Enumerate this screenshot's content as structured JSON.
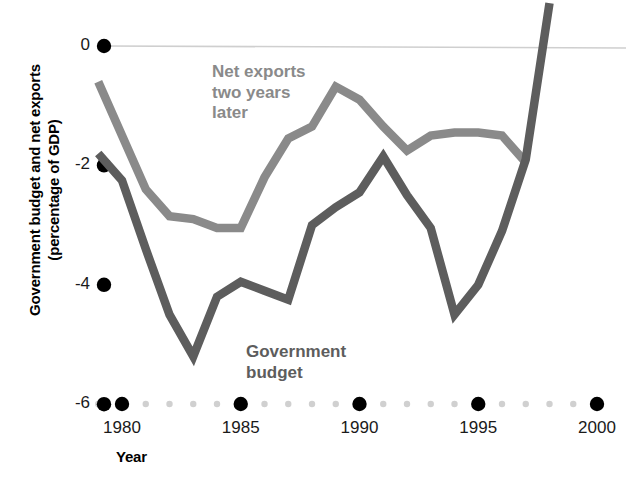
{
  "chart_data": {
    "type": "line",
    "title": "",
    "xlabel": "Year",
    "ylabel": "Government budget and net exports (percentage of GDP)",
    "ylabel_line1": "Government budget and net exports",
    "ylabel_line2": "(percentage of GDP)",
    "xlim": [
      1979,
      2000.5
    ],
    "ylim": [
      -6,
      1
    ],
    "grid": false,
    "zero_line": true,
    "x_tick_labels": [
      "1980",
      "1985",
      "1990",
      "1995",
      "2000"
    ],
    "x_tick_values": [
      1980,
      1985,
      1990,
      1995,
      2000
    ],
    "x_minor_values": [
      1979,
      1981,
      1982,
      1983,
      1984,
      1986,
      1987,
      1988,
      1989,
      1991,
      1992,
      1993,
      1994,
      1996,
      1997,
      1998,
      1999
    ],
    "y_tick_labels": [
      "0",
      "-2",
      "-4",
      "-6"
    ],
    "y_tick_values": [
      0,
      -2,
      -4,
      -6
    ],
    "legend_position": "inline-annotations",
    "colors": {
      "net_exports": "#8a8a8a",
      "government_budget": "#5d5d5d",
      "zero_line": "#cfcfcf",
      "tick_major": "#000000",
      "tick_minor": "#d0d0d0",
      "text": "#000000"
    },
    "series": [
      {
        "name": "Net exports two years later",
        "label_text": "Net exports\ntwo years\nlater",
        "color": "#8a8a8a",
        "x": [
          1979,
          1980,
          1981,
          1982,
          1983,
          1984,
          1985,
          1986,
          1987,
          1988,
          1989,
          1990,
          1991,
          1992,
          1993,
          1994,
          1995,
          1996,
          1997
        ],
        "values": [
          -0.6,
          -1.5,
          -2.4,
          -2.85,
          -2.9,
          -3.05,
          -3.05,
          -2.2,
          -1.55,
          -1.35,
          -0.68,
          -0.9,
          -1.35,
          -1.75,
          -1.5,
          -1.45,
          -1.45,
          -1.5,
          -1.95
        ]
      },
      {
        "name": "Government budget",
        "label_text": "Government\nbudget",
        "color": "#5d5d5d",
        "x": [
          1979,
          1980,
          1981,
          1982,
          1983,
          1984,
          1985,
          1986,
          1987,
          1988,
          1989,
          1990,
          1991,
          1992,
          1993,
          1994,
          1995,
          1996,
          1997,
          1998
        ],
        "values": [
          -1.8,
          -2.25,
          -3.4,
          -4.5,
          -5.2,
          -4.2,
          -3.95,
          -4.1,
          -4.25,
          -3.0,
          -2.7,
          -2.45,
          -1.85,
          -2.5,
          -3.05,
          -4.5,
          -4.0,
          -3.1,
          -1.9,
          0.72
        ]
      }
    ]
  },
  "axis": {
    "x_title": "Year",
    "y_title_line1": "Government budget and net exports",
    "y_title_line2": "(percentage of GDP)"
  }
}
